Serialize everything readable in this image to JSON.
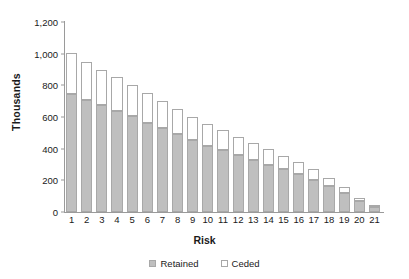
{
  "chart_data": {
    "type": "bar",
    "stacked": true,
    "title": "",
    "xlabel": "Risk",
    "ylabel": "Thousands",
    "categories": [
      "1",
      "2",
      "3",
      "4",
      "5",
      "6",
      "7",
      "8",
      "9",
      "10",
      "11",
      "12",
      "13",
      "14",
      "15",
      "16",
      "17",
      "18",
      "19",
      "20",
      "21"
    ],
    "series": [
      {
        "name": "Retained",
        "color": "#bfbfbf",
        "values": [
          745,
          710,
          675,
          640,
          605,
          565,
          530,
          490,
          455,
          420,
          390,
          360,
          330,
          300,
          270,
          240,
          205,
          165,
          120,
          70,
          30
        ]
      },
      {
        "name": "Ceded",
        "color": "#ffffff",
        "values": [
          260,
          240,
          225,
          210,
          200,
          185,
          170,
          160,
          145,
          135,
          125,
          115,
          105,
          95,
          85,
          75,
          65,
          50,
          35,
          20,
          8
        ]
      }
    ],
    "totals": [
      1005,
      950,
      900,
      850,
      805,
      750,
      700,
      650,
      600,
      555,
      515,
      475,
      435,
      395,
      355,
      315,
      270,
      215,
      155,
      90,
      38
    ],
    "yticks": [
      0,
      200,
      400,
      600,
      800,
      1000,
      1200
    ],
    "ytick_labels": [
      "0",
      "200",
      "400",
      "600",
      "800",
      "1,000",
      "1,200"
    ],
    "ylim": [
      0,
      1200
    ],
    "grid": false,
    "legend_position": "bottom"
  },
  "legend": {
    "retained_label": "Retained",
    "ceded_label": "Ceded"
  }
}
